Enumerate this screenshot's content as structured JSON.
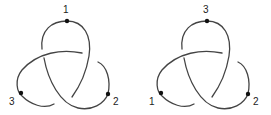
{
  "diagram": {
    "type": "trefoil-knot-pair",
    "stroke_color": "#444444",
    "dot_color": "#111111",
    "knots": [
      {
        "name": "left-trefoil",
        "labels": {
          "top": "1",
          "right": "2",
          "left": "3"
        }
      },
      {
        "name": "right-trefoil",
        "labels": {
          "top": "3",
          "right": "2",
          "left": "1"
        }
      }
    ]
  }
}
